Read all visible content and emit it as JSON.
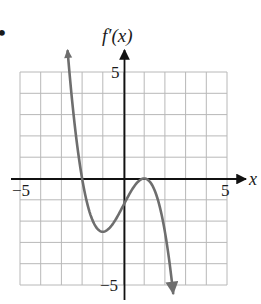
{
  "figure": {
    "bullet": "•",
    "y_axis_label": "f′(x)",
    "x_axis_label": "x",
    "tick_labels": {
      "x_min": "−5",
      "x_max": "5",
      "y_max": "5",
      "y_min": "−5"
    }
  },
  "colors": {
    "grid": "#b8b8b8",
    "axis": "#111111",
    "curve": "#6e6e6e",
    "text": "#1a1a1a"
  },
  "chart_data": {
    "type": "line",
    "title": "",
    "xlabel": "x",
    "ylabel": "f′(x)",
    "xlim": [
      -5,
      5
    ],
    "ylim": [
      -5,
      5
    ],
    "grid": true,
    "grid_step": 1,
    "tick_labels_x": [
      "−5",
      "5"
    ],
    "tick_labels_y": [
      "5",
      "−5"
    ],
    "legend": null,
    "series": [
      {
        "name": "f′(x)",
        "description": "Curve enters from top-left (arrow up near x≈-2.7), crosses x-axis at x=-2, local minimum near (-1, -2.5), crosses y-axis near y=-1.25, touches x-axis (local max) at x=1, then falls off bottom (arrow down near x≈2.4). Approximately f′(x) = -0.625(x+2)(x-1)^2.",
        "x": [
          -2.7,
          -2.5,
          -2.0,
          -1.5,
          -1.0,
          -0.5,
          0.0,
          0.5,
          1.0,
          1.5,
          2.0,
          2.4
        ],
        "y": [
          5.8,
          3.52,
          0.0,
          -1.95,
          -2.5,
          -2.11,
          -1.25,
          -0.39,
          0.0,
          -0.55,
          -2.5,
          -4.9
        ]
      }
    ],
    "annotations": [
      {
        "type": "zero",
        "x": -2,
        "y": 0
      },
      {
        "type": "local_min",
        "x": -1,
        "y": -2.5
      },
      {
        "type": "tangent_zero",
        "x": 1,
        "y": 0
      }
    ],
    "arrows": {
      "curve_start": "up",
      "curve_end": "down",
      "x_axis": "right",
      "y_axis": "up"
    }
  }
}
